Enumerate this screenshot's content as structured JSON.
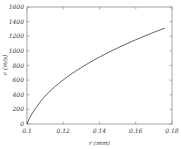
{
  "chart_data": {
    "type": "line",
    "title": "",
    "xlabel": "r (mm)",
    "ylabel": "v (m/s)",
    "xlim": [
      0.1,
      0.18
    ],
    "ylim": [
      0,
      1600
    ],
    "grid": false,
    "legend": null,
    "xticks": [
      0.1,
      0.12,
      0.14,
      0.16,
      0.18
    ],
    "xticklabels": [
      "0.1",
      "0.12",
      "0.14",
      "0.16",
      "0.18"
    ],
    "yticks": [
      0,
      200,
      400,
      600,
      800,
      1000,
      1200,
      1400,
      1600
    ],
    "yticklabels": [
      "0",
      "200",
      "400",
      "600",
      "800",
      "1000",
      "1200",
      "1400",
      "1600"
    ],
    "series": [
      {
        "name": "velocity",
        "color": "#3a3a3a",
        "x": [
          0.1,
          0.1015,
          0.103,
          0.105,
          0.1075,
          0.11,
          0.1125,
          0.115,
          0.1175,
          0.12,
          0.1225,
          0.125,
          0.1275,
          0.13,
          0.1325,
          0.135,
          0.1375,
          0.14,
          0.1425,
          0.145,
          0.1475,
          0.15,
          0.1525,
          0.155,
          0.1575,
          0.16,
          0.1625,
          0.165,
          0.1675,
          0.17,
          0.1725,
          0.1745,
          0.176
        ],
        "y": [
          0,
          86,
          150,
          225,
          310,
          382,
          445,
          502,
          555,
          604,
          650,
          693,
          734,
          773,
          811,
          847,
          882,
          916,
          948,
          980,
          1010,
          1040,
          1069,
          1097,
          1125,
          1152,
          1178,
          1204,
          1229,
          1254,
          1278,
          1297,
          1311
        ]
      }
    ]
  },
  "axes": {
    "x_title": "r (mm)",
    "y_title": "v (m/s)"
  }
}
